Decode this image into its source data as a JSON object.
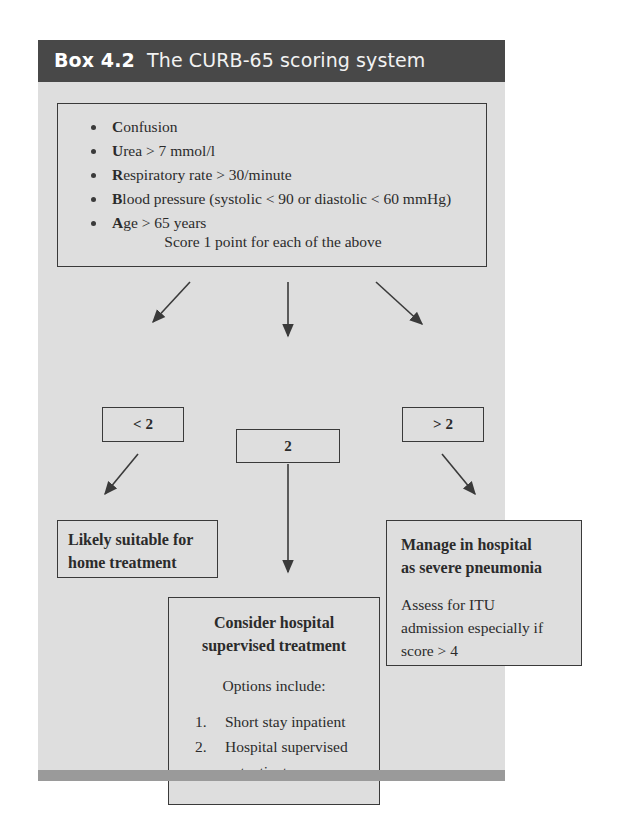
{
  "box": {
    "label": "Box 4.2",
    "title": "The CURB-65 scoring system",
    "header_bg": "#484848",
    "body_bg": "#dedede",
    "footer_bg": "#9a9a9a",
    "line_color": "#3a3a3a"
  },
  "criteria": {
    "items": [
      {
        "initial": "C",
        "rest": "onfusion"
      },
      {
        "initial": "U",
        "rest": "rea > 7 mmol/l"
      },
      {
        "initial": "R",
        "rest": "espiratory rate > 30/minute"
      },
      {
        "initial": "B",
        "rest": "lood pressure (systolic < 90 or diastolic < 60 mmHg)"
      },
      {
        "initial": "A",
        "rest": "ge > 65 years"
      }
    ],
    "score_note": "Score 1 point for each of the above"
  },
  "scores": {
    "low": "< 2",
    "mid": "2",
    "high": "> 2"
  },
  "outcomes": {
    "home": {
      "line1": "Likely suitable for",
      "line2": "home treatment"
    },
    "consider": {
      "head1": "Consider hospital",
      "head2": "supervised treatment",
      "options_label": "Options include:",
      "options": [
        {
          "num": "1.",
          "line1": "Short stay inpatient",
          "line2": ""
        },
        {
          "num": "2.",
          "line1": "Hospital supervised",
          "line2": "outpatient"
        }
      ]
    },
    "hospital": {
      "head1": "Manage in hospital",
      "head2": "as severe pneumonia",
      "body1": "Assess for ITU",
      "body2": "admission especially if",
      "body3": "score > 4"
    }
  }
}
